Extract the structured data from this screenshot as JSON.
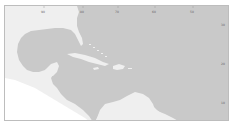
{
  "map": {
    "region": "Gulf of Mexico and Caribbean Sea",
    "colors": {
      "ocean": "#c9c9c9",
      "land": "#efefef",
      "outside": "#ffffff",
      "border": "#bdbdbd"
    },
    "lon_ticks": [
      {
        "label": "90",
        "x": 43
      },
      {
        "label": "80",
        "x": 82
      },
      {
        "label": "70",
        "x": 117
      },
      {
        "label": "60",
        "x": 154
      },
      {
        "label": "50",
        "x": 192
      }
    ],
    "lat_ticks": [
      {
        "label": "30",
        "y": 25
      },
      {
        "label": "20",
        "y": 64
      },
      {
        "label": "10",
        "y": 103
      }
    ]
  }
}
